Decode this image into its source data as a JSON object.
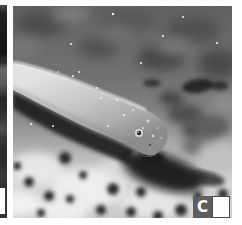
{
  "panel": {
    "label": "C"
  },
  "figure": {
    "type": "black-and-white underwater photograph",
    "adjacent_panel": "left edge sliver of neighboring photo panel with its own white scale marker"
  },
  "colors": {
    "page_background": "#ffffff",
    "label_box": "#5e5e5e",
    "label_text": "#ffffff",
    "scale_marker_fill": "#fdfdfd",
    "scale_marker_border": "#4a4a4a",
    "photo_dark_shadow": "#101010",
    "eel_body_light": "#dcdcdc",
    "seafloor_light": "#ececec",
    "background_gray": "#6e6e6e"
  }
}
